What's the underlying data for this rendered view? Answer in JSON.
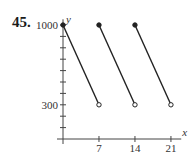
{
  "problem_number": "45.",
  "colors": {
    "line": "#222222",
    "axis": "#444444",
    "text": "#333333",
    "background": "#ffffff"
  },
  "chart_data": {
    "type": "line",
    "title": "",
    "xlabel": "x",
    "ylabel": "y",
    "x_ticks": [
      7,
      14,
      21
    ],
    "x_tick_labels": [
      "7",
      "14",
      "21"
    ],
    "y_ticks": [
      100,
      200,
      300,
      400,
      500,
      600,
      700,
      800,
      900,
      1000
    ],
    "y_tick_labels": [
      {
        "value": 300,
        "label": "300"
      },
      {
        "value": 1000,
        "label": "1000"
      }
    ],
    "xlim": [
      0,
      23
    ],
    "ylim": [
      0,
      1050
    ],
    "grid": false,
    "series": [
      {
        "name": "segment-1",
        "x": [
          0,
          7
        ],
        "y": [
          1000,
          300
        ],
        "start": "closed",
        "end": "open"
      },
      {
        "name": "segment-2",
        "x": [
          7,
          14
        ],
        "y": [
          1000,
          300
        ],
        "start": "closed",
        "end": "open"
      },
      {
        "name": "segment-3",
        "x": [
          14,
          21
        ],
        "y": [
          1000,
          300
        ],
        "start": "closed",
        "end": "open"
      }
    ]
  }
}
